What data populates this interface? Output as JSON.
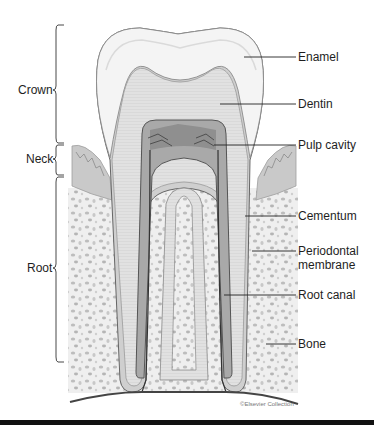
{
  "diagram": {
    "region_labels": [
      {
        "id": "crown",
        "text": "Crown"
      },
      {
        "id": "neck",
        "text": "Neck"
      },
      {
        "id": "root",
        "text": "Root"
      }
    ],
    "structure_labels": [
      {
        "id": "enamel",
        "text": "Enamel"
      },
      {
        "id": "dentin",
        "text": "Dentin"
      },
      {
        "id": "pulp-cavity",
        "text": "Pulp cavity"
      },
      {
        "id": "cementum",
        "text": "Cementum"
      },
      {
        "id": "periodontal-membrane",
        "text": "Periodontal\nmembrane",
        "line1": "Periodontal",
        "line2": "membrane"
      },
      {
        "id": "root-canal",
        "text": "Root canal"
      },
      {
        "id": "bone",
        "text": "Bone"
      }
    ],
    "credit": "©Elsevier Collection",
    "colors": {
      "enamel": "#f2f2f2",
      "dentin": "#dcdcdc",
      "pulp": "#9a9a9a",
      "gum": "#c8c8c8",
      "bone": "#ebebeb",
      "outline": "#555555"
    }
  }
}
